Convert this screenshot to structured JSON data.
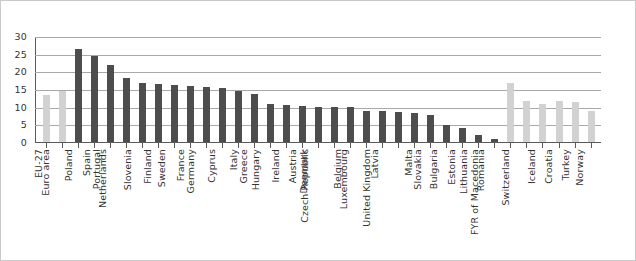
{
  "chart_data": {
    "type": "bar",
    "title": "",
    "subtitle": "",
    "xlabel": "",
    "ylabel": "",
    "ylim": [
      0,
      30
    ],
    "ytick_values": [
      30,
      25,
      20,
      15,
      10,
      5,
      0
    ],
    "ytick_labels": [
      "30",
      "25",
      "20",
      "15",
      "10",
      "5",
      "0"
    ],
    "grid": true,
    "legend": "none",
    "categories": [
      "EU-27",
      "Euro area",
      "Poland",
      "Spain",
      "Portugal",
      "Netherlands",
      "Slovenia",
      "Finland",
      "Sweden",
      "France",
      "Germany",
      "Cyprus",
      "Italy",
      "Greece",
      "Hungary",
      "Ireland",
      "Austria",
      "Denmark",
      "Czech Republic",
      "Belgium",
      "Luxembourg",
      "Latvia",
      "United Kingdom",
      "Malta",
      "Slovakia",
      "Bulgaria",
      "Estonia",
      "Lithuania",
      "Romania",
      "FYR of Macedonia",
      "Switzerland",
      "Iceland",
      "Croatia",
      "Turkey",
      "Norway"
    ],
    "values": [
      13.5,
      14.8,
      26.5,
      24.5,
      22.0,
      18.5,
      17.0,
      16.8,
      16.3,
      16.0,
      15.8,
      15.5,
      14.8,
      14.0,
      11.0,
      10.8,
      10.5,
      10.3,
      10.2,
      10.1,
      9.2,
      9.0,
      8.7,
      8.5,
      8.0,
      5.2,
      4.3,
      2.2,
      1.0,
      17.0,
      12.0,
      11.0,
      12.0,
      11.5,
      9.0
    ],
    "bar_styles": [
      "light",
      "light",
      "dark",
      "dark",
      "dark",
      "dark",
      "dark",
      "dark",
      "dark",
      "dark",
      "dark",
      "dark",
      "dark",
      "dark",
      "dark",
      "dark",
      "dark",
      "dark",
      "dark",
      "dark",
      "dark",
      "dark",
      "dark",
      "dark",
      "dark",
      "dark",
      "dark",
      "dark",
      "dark",
      "light",
      "light",
      "light",
      "light",
      "light",
      "light"
    ],
    "colors": {
      "dark_bar": "#4d4d4d",
      "light_bar": "#d2d2d2",
      "gridline": "#a8a8a8",
      "axis": "#5a5a5a",
      "text": "#333333",
      "background": "#ffffff",
      "border": "#c9c9c9"
    }
  }
}
